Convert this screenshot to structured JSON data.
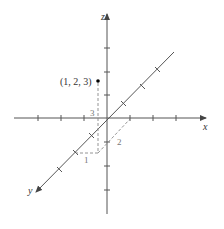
{
  "figure": {
    "axes": {
      "x_label": "x",
      "y_label": "y",
      "z_label": "z"
    },
    "point": {
      "label": "(1, 2, 3)",
      "coords": [
        1,
        2,
        3
      ]
    },
    "projection_labels": {
      "x_value": "1",
      "y_value": "2",
      "z_value": "3"
    },
    "colors": {
      "axis": "#555555",
      "dashed": "#888888",
      "point": "#000000"
    }
  }
}
